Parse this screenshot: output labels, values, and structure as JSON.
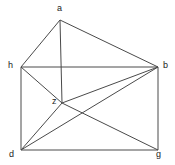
{
  "figure": {
    "kind": "undirected-graph-drawing",
    "width": 175,
    "height": 165,
    "background_color": "#ffffff",
    "edge_color": "#4a4a4a",
    "label_color": "#1a1a1a",
    "edge_width": 1
  },
  "vertices": [
    {
      "id": "a",
      "label": "a",
      "x": 60,
      "y": 20,
      "label_x": 57,
      "label_y": 4
    },
    {
      "id": "h",
      "label": "h",
      "x": 21,
      "y": 67,
      "label_x": 8,
      "label_y": 61
    },
    {
      "id": "b",
      "label": "b",
      "x": 158,
      "y": 67,
      "label_x": 163,
      "label_y": 61
    },
    {
      "id": "z",
      "label": "z",
      "x": 62,
      "y": 103,
      "label_x": 52,
      "label_y": 97
    },
    {
      "id": "d",
      "label": "d",
      "x": 21,
      "y": 150,
      "label_x": 9,
      "label_y": 150
    },
    {
      "id": "g",
      "label": "g",
      "x": 158,
      "y": 150,
      "label_x": 156,
      "label_y": 150
    }
  ],
  "edges": [
    {
      "from": "a",
      "to": "h"
    },
    {
      "from": "a",
      "to": "b"
    },
    {
      "from": "a",
      "to": "z"
    },
    {
      "from": "h",
      "to": "b"
    },
    {
      "from": "h",
      "to": "z"
    },
    {
      "from": "h",
      "to": "d"
    },
    {
      "from": "z",
      "to": "b"
    },
    {
      "from": "z",
      "to": "d"
    },
    {
      "from": "z",
      "to": "g"
    },
    {
      "from": "d",
      "to": "b"
    },
    {
      "from": "d",
      "to": "g"
    },
    {
      "from": "b",
      "to": "g"
    }
  ]
}
